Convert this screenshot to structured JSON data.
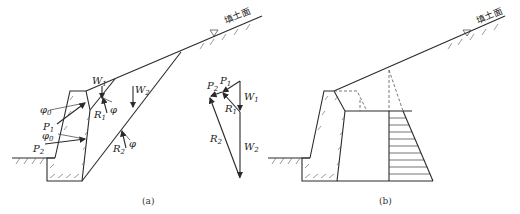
{
  "panel_a": {
    "caption": "(a)",
    "surface_label": "填土面",
    "labels": {
      "W1": "W",
      "W1_sub": "1",
      "W2": "W",
      "W2_sub": "2",
      "R1": "R",
      "R1_sub": "1",
      "R2": "R",
      "R2_sub": "2",
      "P1": "P",
      "P1_sub": "1",
      "P2": "P",
      "P2_sub": "2",
      "phi0": "φ",
      "phi0_sub": "0",
      "phi": "φ"
    },
    "force_polygon": {
      "P1": "P",
      "P1_sub": "1",
      "P2": "P",
      "P2_sub": "2",
      "W1": "W",
      "W1_sub": "1",
      "W2": "W",
      "W2_sub": "2",
      "R1": "R",
      "R1_sub": "1",
      "R2": "R",
      "R2_sub": "2"
    }
  },
  "panel_b": {
    "caption": "(b)",
    "surface_label": "填土面"
  }
}
